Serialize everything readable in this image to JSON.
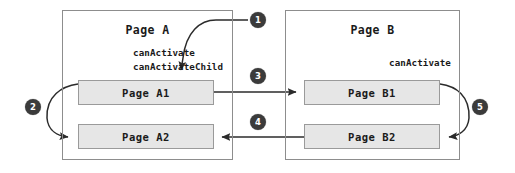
{
  "diagram": {
    "colors": {
      "outer_border": "#8d8d8d",
      "inner_border": "#9a9a9a",
      "inner_fill": "#e6e6e6",
      "badge_fill": "#3b3b3b",
      "badge_text": "#ffffff",
      "arrow": "#2b2b2b",
      "background": "#ffffff"
    },
    "groups": [
      {
        "id": "page-a",
        "title": "Page A",
        "guards": [
          "canActivate",
          "canActivateChild"
        ],
        "guards_align": "left",
        "children": [
          {
            "id": "page-a1",
            "label": "Page A1"
          },
          {
            "id": "page-a2",
            "label": "Page A2"
          }
        ]
      },
      {
        "id": "page-b",
        "title": "Page B",
        "guards": [
          "canActivate"
        ],
        "guards_align": "right",
        "children": [
          {
            "id": "page-b1",
            "label": "Page B1"
          },
          {
            "id": "page-b2",
            "label": "Page B2"
          }
        ]
      }
    ],
    "badges": [
      {
        "id": "badge-1",
        "number": "1"
      },
      {
        "id": "badge-2",
        "number": "2"
      },
      {
        "id": "badge-3",
        "number": "3"
      },
      {
        "id": "badge-4",
        "number": "4"
      },
      {
        "id": "badge-5",
        "number": "5"
      }
    ],
    "arrows": [
      {
        "id": "arrow-1",
        "badge": "1",
        "from": "outside",
        "to": "page-a1",
        "shape": "curved"
      },
      {
        "id": "arrow-2",
        "badge": "2",
        "from": "page-a1",
        "to": "page-a2",
        "shape": "curved"
      },
      {
        "id": "arrow-3",
        "badge": "3",
        "from": "page-a1",
        "to": "page-b1",
        "shape": "straight"
      },
      {
        "id": "arrow-4",
        "badge": "4",
        "from": "page-b2",
        "to": "page-a2",
        "shape": "straight"
      },
      {
        "id": "arrow-5",
        "badge": "5",
        "from": "page-b1",
        "to": "page-b2",
        "shape": "curved"
      }
    ]
  }
}
